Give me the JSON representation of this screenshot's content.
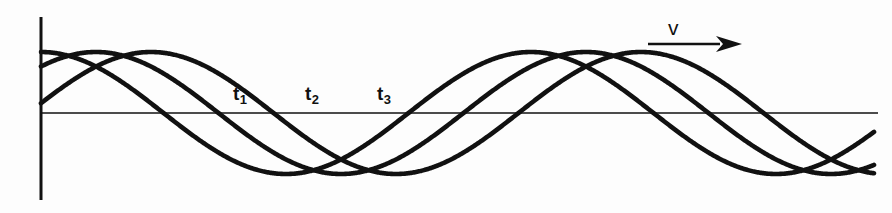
{
  "figure": {
    "width": 892,
    "height": 213,
    "background_color": "#fdfdfd",
    "stroke_color": "#111111"
  },
  "axes": {
    "vertical_axis": {
      "name": "y-axis",
      "x": 41,
      "y_top": 17,
      "y_bottom": 200,
      "line_width": 3
    },
    "horizontal_axis": {
      "name": "x-axis",
      "y": 113,
      "x_left": 41,
      "x_right": 878,
      "line_width": 1.6
    }
  },
  "velocity_marker": {
    "label": "v",
    "label_x": 668,
    "label_y": 17,
    "arrow_x_start": 648,
    "arrow_x_end": 742,
    "arrow_y": 44,
    "arrow_line_width": 2.6,
    "arrow_head_length": 26,
    "arrow_head_half_height": 8
  },
  "time_labels": [
    {
      "label": "t",
      "subscript": "1",
      "x": 233,
      "y": 84
    },
    {
      "label": "t",
      "subscript": "2",
      "x": 305,
      "y": 84
    },
    {
      "label": "t",
      "subscript": "3",
      "x": 377,
      "y": 84
    }
  ],
  "chart_data": {
    "type": "line",
    "title": "",
    "xlabel": "",
    "ylabel": "",
    "grid": false,
    "legend_position": "none",
    "axis_baseline_y": 113,
    "amplitude_px": 61,
    "wavelength_px": 490,
    "x_start": 41,
    "x_end": 874,
    "annotations": [
      {
        "text": "v",
        "x": 668,
        "y": 17,
        "kind": "velocity-direction"
      },
      {
        "text": "t1",
        "x": 233,
        "y": 84,
        "kind": "time-snapshot"
      },
      {
        "text": "t2",
        "x": 305,
        "y": 84,
        "kind": "time-snapshot"
      },
      {
        "text": "t3",
        "x": 377,
        "y": 84,
        "kind": "time-snapshot"
      }
    ],
    "series": [
      {
        "name": "wave-t1",
        "phase_shift_px": 0,
        "start_y_px": 48,
        "line_width": 4.6,
        "description": "snapshot of traveling wave at time t1, starts near crest at left axis"
      },
      {
        "name": "wave-t2",
        "phase_shift_px": 55,
        "start_y_px": 76,
        "line_width": 4.6,
        "description": "snapshot of traveling wave at time t2, shifted right by one phase step"
      },
      {
        "name": "wave-t3",
        "phase_shift_px": 110,
        "start_y_px": 133,
        "line_width": 4.6,
        "description": "snapshot of traveling wave at time t3, shifted right by two phase steps"
      }
    ]
  }
}
